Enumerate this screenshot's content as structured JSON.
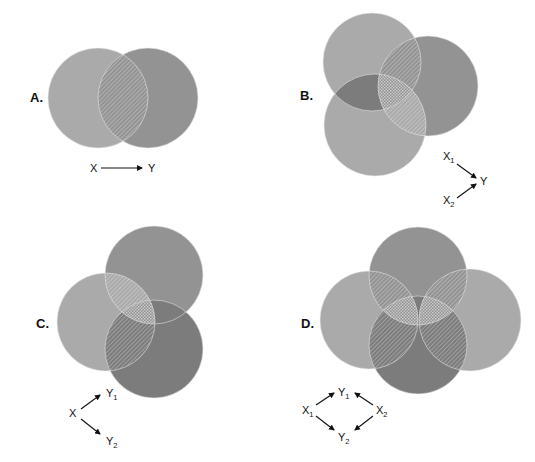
{
  "figure": {
    "background": "#ffffff",
    "colors": {
      "light": "#aaaaaa",
      "medium": "#939393",
      "dark": "#7c7c7c",
      "intersection_line": "#ffffff",
      "outline": "#e8e8e8"
    },
    "panels": [
      {
        "id": "A",
        "label": "A.",
        "label_pos": [
          30,
          102
        ],
        "circles": [
          {
            "name": "X",
            "cx": 98,
            "cy": 98,
            "r": 50,
            "shade": "light"
          },
          {
            "name": "Y",
            "cx": 148,
            "cy": 98,
            "r": 50,
            "shade": "medium"
          }
        ],
        "diagram": {
          "nodes": [
            {
              "id": "X",
              "text": "X",
              "sub": "",
              "x": 90,
              "y": 172
            },
            {
              "id": "Y",
              "text": "Y",
              "sub": "",
              "x": 148,
              "y": 172
            }
          ],
          "arrows": [
            {
              "from": [
                101,
                168
              ],
              "to": [
                142,
                168
              ]
            }
          ]
        }
      },
      {
        "id": "B",
        "label": "B.",
        "label_pos": [
          300,
          100
        ],
        "circles": [
          {
            "name": "X1",
            "cx": 372,
            "cy": 62,
            "r": 49,
            "shade": "light"
          },
          {
            "name": "Y",
            "cx": 428,
            "cy": 86,
            "r": 50,
            "shade": "medium"
          },
          {
            "name": "X2",
            "cx": 375,
            "cy": 125,
            "r": 51,
            "shade": "light"
          }
        ],
        "diagram": {
          "nodes": [
            {
              "id": "X1",
              "text": "X",
              "sub": "1",
              "x": 443,
              "y": 160
            },
            {
              "id": "Y",
              "text": "Y",
              "sub": "",
              "x": 480,
              "y": 185
            },
            {
              "id": "X2",
              "text": "X",
              "sub": "2",
              "x": 443,
              "y": 204
            }
          ],
          "arrows": [
            {
              "from": [
                457,
                164
              ],
              "to": [
                476,
                178
              ]
            },
            {
              "from": [
                457,
                198
              ],
              "to": [
                476,
                184
              ]
            }
          ]
        }
      },
      {
        "id": "C",
        "label": "C.",
        "label_pos": [
          36,
          328
        ],
        "circles": [
          {
            "name": "Y1",
            "cx": 154,
            "cy": 275,
            "r": 49,
            "shade": "medium"
          },
          {
            "name": "X",
            "cx": 106,
            "cy": 322,
            "r": 49,
            "shade": "light"
          },
          {
            "name": "Y2",
            "cx": 154,
            "cy": 349,
            "r": 49,
            "shade": "dark"
          }
        ],
        "diagram": {
          "nodes": [
            {
              "id": "X",
              "text": "X",
              "sub": "",
              "x": 69,
              "y": 417
            },
            {
              "id": "Y1",
              "text": "Y",
              "sub": "1",
              "x": 106,
              "y": 397
            },
            {
              "id": "Y2",
              "text": "Y",
              "sub": "2",
              "x": 106,
              "y": 445
            }
          ],
          "arrows": [
            {
              "from": [
                81,
                409
              ],
              "to": [
                100,
                395
              ]
            },
            {
              "from": [
                81,
                419
              ],
              "to": [
                100,
                434
              ]
            }
          ]
        }
      },
      {
        "id": "D",
        "label": "D.",
        "label_pos": [
          301,
          328
        ],
        "circles": [
          {
            "name": "X1",
            "cx": 369,
            "cy": 320,
            "r": 49,
            "shade": "light"
          },
          {
            "name": "X2",
            "cx": 470,
            "cy": 320,
            "r": 51,
            "shade": "light"
          },
          {
            "name": "Y1",
            "cx": 418,
            "cy": 276,
            "r": 49,
            "shade": "medium"
          },
          {
            "name": "Y2",
            "cx": 418,
            "cy": 345,
            "r": 49,
            "shade": "dark"
          }
        ],
        "diagram": {
          "nodes": [
            {
              "id": "X1",
              "text": "X",
              "sub": "1",
              "x": 302,
              "y": 414
            },
            {
              "id": "Y1",
              "text": "Y",
              "sub": "1",
              "x": 338,
              "y": 396
            },
            {
              "id": "X2",
              "text": "X",
              "sub": "2",
              "x": 376,
              "y": 414
            },
            {
              "id": "Y2",
              "text": "Y",
              "sub": "2",
              "x": 338,
              "y": 441
            }
          ],
          "arrows": [
            {
              "from": [
                316,
                405
              ],
              "to": [
                334,
                393
              ]
            },
            {
              "from": [
                373,
                405
              ],
              "to": [
                355,
                393
              ]
            },
            {
              "from": [
                316,
                416
              ],
              "to": [
                334,
                430
              ]
            },
            {
              "from": [
                373,
                416
              ],
              "to": [
                355,
                430
              ]
            }
          ]
        }
      }
    ]
  }
}
